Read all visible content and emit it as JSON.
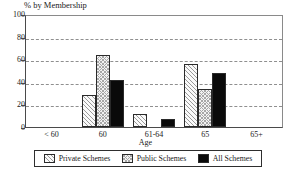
{
  "chart_data": {
    "type": "bar",
    "title": "% by Membership",
    "subtitle": "",
    "xlabel": "Age",
    "ylabel": "",
    "categories": [
      "< 60",
      "60",
      "61-64",
      "65",
      "65+"
    ],
    "series": [
      {
        "name": "Private Schemes",
        "values": [
          0,
          29,
          12,
          57,
          0
        ],
        "pattern": "diagonal-hatch",
        "color": "#fafafa"
      },
      {
        "name": "Public Schemes",
        "values": [
          0,
          65,
          0,
          34,
          0
        ],
        "pattern": "checkerboard",
        "color": "#f2f2f2"
      },
      {
        "name": "All Schemes",
        "values": [
          0,
          42,
          7,
          49,
          0
        ],
        "pattern": "solid",
        "color": "#0a0a0a"
      }
    ],
    "ylim": [
      0,
      100
    ],
    "yticks": [
      0,
      20,
      40,
      60,
      80,
      100
    ],
    "ytick_labels": [
      "0",
      "20",
      "40",
      "60",
      "80",
      "100"
    ],
    "grid": true,
    "grid_axis": "y",
    "grid_style": "dashed",
    "legend_position": "bottom",
    "legend_boxed": true
  },
  "axis": {
    "y_labels": [
      "100",
      "80",
      "60",
      "40",
      "20",
      "0"
    ],
    "x_labels": [
      "< 60",
      "60",
      "61-64",
      "65",
      "65+"
    ],
    "x_title": "Age"
  },
  "legend": {
    "items": [
      {
        "label": "Private Schemes"
      },
      {
        "label": "Public Schemes"
      },
      {
        "label": "All Schemes"
      }
    ]
  }
}
